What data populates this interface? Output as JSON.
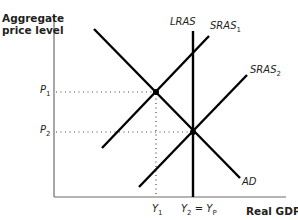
{
  "diagram": {
    "title": "",
    "axes": {
      "y_label_line1": "Aggregate",
      "y_label_line2": "price level",
      "x_label": "Real GDP"
    },
    "curves": [
      {
        "name": "LRAS",
        "label": "LRAS",
        "type": "vertical"
      },
      {
        "name": "SRAS1",
        "label": "SRAS",
        "subscript": "1",
        "type": "upward-sloping"
      },
      {
        "name": "SRAS2",
        "label": "SRAS",
        "subscript": "2",
        "type": "upward-sloping"
      },
      {
        "name": "AD",
        "label": "AD",
        "type": "downward-sloping"
      }
    ],
    "y_ticks": [
      {
        "label": "P",
        "subscript": "1"
      },
      {
        "label": "P",
        "subscript": "2"
      }
    ],
    "x_ticks": [
      {
        "label": "Y",
        "subscript": "1"
      },
      {
        "label_left": "Y",
        "subscript_left": "2",
        "equals": " = ",
        "label_right": "Y",
        "subscript_right": "P"
      }
    ],
    "equilibria": [
      {
        "name": "E1",
        "price": "P1",
        "output": "Y1",
        "curves": [
          "AD",
          "SRAS1"
        ]
      },
      {
        "name": "E2",
        "price": "P2",
        "output": "Y2 = YP",
        "curves": [
          "AD",
          "SRAS2",
          "LRAS"
        ]
      }
    ],
    "colors": {
      "line": "#000000",
      "text": "#231f20",
      "axis": "#555555",
      "dots": "#444444"
    }
  }
}
